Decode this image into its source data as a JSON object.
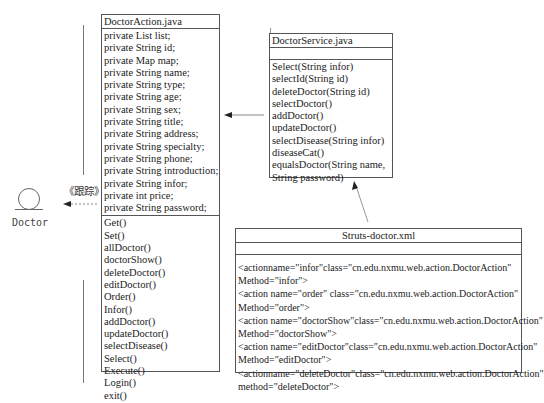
{
  "actor": {
    "label": "Doctor",
    "stereotype": "《跟踪》"
  },
  "doctor_action": {
    "title": "DoctorAction.java",
    "attributes": [
      "private List list;",
      "private String id;",
      "private Map map;",
      "private String name;",
      "private String type;",
      "private String age;",
      "private String sex;",
      "private String title;",
      "private String address;",
      "private String specialty;",
      "private String phone;",
      "private String introduction;",
      "private String infor;",
      "private int price;",
      "private String password;"
    ],
    "methods": [
      "Get()",
      "Set()",
      "allDoctor()",
      "doctorShow()",
      "deleteDoctor()",
      "editDoctor()",
      "Order()",
      "Infor()",
      "addDoctor()",
      "updateDoctor()",
      "selectDisease()",
      "Select()",
      "Execute()",
      "Login()",
      "exit()"
    ]
  },
  "doctor_service": {
    "title": "DoctorService.java",
    "methods": [
      "Select(String infor)",
      "selectId(String id)",
      "deleteDoctor(String id)",
      "selectDoctor()",
      "addDoctor()",
      "updateDoctor()",
      "selectDisease(String infor)",
      "diseaseCat()",
      "equalsDoctor(String name,",
      "String password)"
    ]
  },
  "struts_xml": {
    "title": "Struts-doctor.xml",
    "lines": [
      "<actionname=\"infor\"class=\"cn.edu.nxmu.web.action.DoctorAction\"",
      "Method=\"infor\">",
      "<action name=\"order\" class=\"cn.edu.nxmu.web.action.DoctorAction\"",
      "Method=\"order\">",
      "<action name=\"doctorShow\"class=\"cn.edu.nxmu.web.action.DoctorAction\"",
      "Method=\"doctorShow\">",
      "<action name=\"editDoctor\"class=\"cn.edu.nxmu.web.action.DoctorAction\"",
      "Method=\"editDoctor\">",
      "<actionname=\"deleteDoctor\"class=\"cn.edu.nxmu.web.action.DoctorAction\"",
      "method=\"deleteDoctor\">"
    ]
  }
}
